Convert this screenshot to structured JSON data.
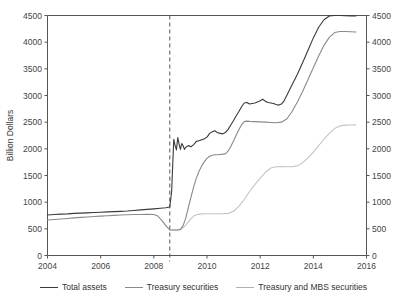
{
  "chart_data": {
    "type": "line",
    "title": "",
    "xlabel": "",
    "ylabel": "Billion Dollars",
    "xlim": [
      2004,
      2016
    ],
    "ylim": [
      0,
      4500
    ],
    "xticks": [
      "2004",
      "2006",
      "2008",
      "2010",
      "2012",
      "2014",
      "2016"
    ],
    "xtick_values": [
      2004,
      2006,
      2008,
      2010,
      2012,
      2014,
      2016
    ],
    "yticks": [
      "0",
      "500",
      "1000",
      "1500",
      "2000",
      "2500",
      "3000",
      "3500",
      "4000",
      "4500"
    ],
    "ytick_values": [
      0,
      500,
      1000,
      1500,
      2000,
      2500,
      3000,
      3500,
      4000,
      4500
    ],
    "right_axis_yticks": [
      "0",
      "500",
      "1000",
      "1500",
      "2000",
      "2500",
      "3000",
      "3500",
      "4000",
      "4500"
    ],
    "grid": false,
    "legend_position": "bottom",
    "annotations": [
      {
        "name": "crisis-marker",
        "type": "vertical-dashed-line",
        "x": 2008.6,
        "label": ""
      }
    ],
    "series": [
      {
        "name": "Total assets",
        "color": "#3a3a3a",
        "x": [
          2004.0,
          2004.25,
          2004.5,
          2004.75,
          2005.0,
          2005.25,
          2005.5,
          2005.75,
          2006.0,
          2006.25,
          2006.5,
          2006.75,
          2007.0,
          2007.25,
          2007.5,
          2007.75,
          2008.0,
          2008.25,
          2008.45,
          2008.6,
          2008.67,
          2008.75,
          2008.8,
          2008.85,
          2008.9,
          2008.95,
          2009.0,
          2009.05,
          2009.1,
          2009.15,
          2009.2,
          2009.3,
          2009.4,
          2009.5,
          2009.6,
          2009.7,
          2009.8,
          2009.9,
          2010.0,
          2010.1,
          2010.2,
          2010.3,
          2010.4,
          2010.5,
          2010.6,
          2010.7,
          2010.8,
          2010.9,
          2011.0,
          2011.1,
          2011.2,
          2011.3,
          2011.4,
          2011.5,
          2011.6,
          2011.7,
          2011.8,
          2011.9,
          2012.0,
          2012.1,
          2012.2,
          2012.3,
          2012.4,
          2012.5,
          2012.6,
          2012.7,
          2012.8,
          2012.9,
          2013.0,
          2013.2,
          2013.4,
          2013.6,
          2013.8,
          2014.0,
          2014.2,
          2014.4,
          2014.6,
          2014.8,
          2015.0,
          2015.2,
          2015.4,
          2015.6
        ],
        "values": [
          760,
          768,
          775,
          780,
          790,
          795,
          800,
          805,
          812,
          818,
          822,
          828,
          835,
          845,
          855,
          865,
          875,
          885,
          895,
          910,
          1200,
          2180,
          2060,
          1980,
          2210,
          2090,
          1990,
          2100,
          2060,
          1990,
          2030,
          2060,
          2040,
          2080,
          2140,
          2150,
          2170,
          2190,
          2220,
          2290,
          2320,
          2340,
          2300,
          2290,
          2280,
          2310,
          2370,
          2450,
          2530,
          2620,
          2700,
          2790,
          2860,
          2870,
          2840,
          2850,
          2860,
          2880,
          2900,
          2930,
          2890,
          2870,
          2860,
          2850,
          2830,
          2820,
          2840,
          2900,
          3000,
          3200,
          3400,
          3620,
          3850,
          4080,
          4280,
          4420,
          4490,
          4500,
          4500,
          4495,
          4490,
          4490
        ]
      },
      {
        "name": "Treasury securities",
        "color": "#8a8a8a",
        "x": [
          2004.0,
          2004.25,
          2004.5,
          2004.75,
          2005.0,
          2005.25,
          2005.5,
          2005.75,
          2006.0,
          2006.25,
          2006.5,
          2006.75,
          2007.0,
          2007.25,
          2007.5,
          2007.75,
          2008.0,
          2008.15,
          2008.3,
          2008.45,
          2008.6,
          2008.75,
          2008.9,
          2009.0,
          2009.1,
          2009.2,
          2009.3,
          2009.4,
          2009.5,
          2009.6,
          2009.7,
          2009.8,
          2009.9,
          2010.0,
          2010.1,
          2010.2,
          2010.3,
          2010.4,
          2010.5,
          2010.6,
          2010.7,
          2010.8,
          2010.9,
          2011.0,
          2011.1,
          2011.2,
          2011.3,
          2011.4,
          2011.5,
          2011.6,
          2011.8,
          2012.0,
          2012.2,
          2012.4,
          2012.6,
          2012.8,
          2013.0,
          2013.2,
          2013.4,
          2013.6,
          2013.8,
          2014.0,
          2014.2,
          2014.4,
          2014.6,
          2014.8,
          2015.0,
          2015.2,
          2015.4,
          2015.6
        ],
        "values": [
          665,
          675,
          685,
          695,
          705,
          715,
          722,
          730,
          738,
          745,
          752,
          758,
          765,
          768,
          770,
          772,
          770,
          740,
          660,
          560,
          480,
          478,
          478,
          490,
          560,
          700,
          900,
          1100,
          1290,
          1450,
          1580,
          1680,
          1760,
          1820,
          1860,
          1880,
          1890,
          1890,
          1895,
          1900,
          1910,
          1960,
          2050,
          2150,
          2260,
          2360,
          2450,
          2510,
          2520,
          2515,
          2510,
          2505,
          2500,
          2495,
          2490,
          2500,
          2560,
          2700,
          2880,
          3080,
          3300,
          3520,
          3740,
          3940,
          4090,
          4180,
          4200,
          4200,
          4195,
          4190
        ]
      },
      {
        "name": "Treasury and MBS securities",
        "color": "#c4c4c4",
        "x": [
          2008.6,
          2008.75,
          2008.9,
          2009.0,
          2009.1,
          2009.2,
          2009.3,
          2009.4,
          2009.5,
          2009.6,
          2009.7,
          2009.8,
          2009.9,
          2010.0,
          2010.2,
          2010.4,
          2010.6,
          2010.8,
          2011.0,
          2011.2,
          2011.4,
          2011.6,
          2011.8,
          2012.0,
          2012.2,
          2012.4,
          2012.6,
          2012.8,
          2013.0,
          2013.2,
          2013.4,
          2013.6,
          2013.8,
          2014.0,
          2014.2,
          2014.4,
          2014.6,
          2014.8,
          2015.0,
          2015.2,
          2015.4,
          2015.6
        ],
        "values": [
          478,
          478,
          480,
          490,
          520,
          570,
          630,
          690,
          740,
          765,
          775,
          780,
          782,
          782,
          782,
          783,
          785,
          790,
          830,
          920,
          1050,
          1200,
          1330,
          1450,
          1560,
          1640,
          1665,
          1670,
          1665,
          1665,
          1680,
          1740,
          1830,
          1940,
          2060,
          2180,
          2290,
          2380,
          2430,
          2445,
          2448,
          2450
        ]
      }
    ]
  },
  "legend": {
    "items": [
      {
        "label": "Total assets",
        "color": "#3a3a3a"
      },
      {
        "label": "Treasury securities",
        "color": "#8a8a8a"
      },
      {
        "label": "Treasury and MBS securities",
        "color": "#b0b0b0"
      }
    ]
  },
  "colors": {
    "axis": "#555555",
    "text": "#333333",
    "background": "#ffffff"
  }
}
